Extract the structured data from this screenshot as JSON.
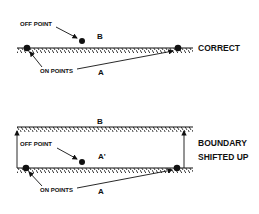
{
  "diagrams": [
    {
      "id": "correct",
      "caption": "CORRECT",
      "off_point_label": "OFF POINT",
      "on_points_label": "ON POINTS",
      "region_above_label": "B",
      "region_below_label": "A"
    },
    {
      "id": "shifted",
      "caption_line1": "BOUNDARY",
      "caption_line2": "SHIFTED UP",
      "off_point_label": "OFF POINT",
      "on_points_label": "ON POINTS",
      "region_above_label": "B",
      "region_middle_label": "A'",
      "region_below_label": "A"
    }
  ],
  "colors": {
    "ink": "#111111",
    "background": "#ffffff"
  }
}
